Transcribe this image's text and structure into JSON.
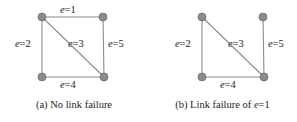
{
  "figure": {
    "background_color": "#ffffff",
    "node_color": "#8c8c8c",
    "node_stroke_color": "#6f6f6f",
    "edge_color": "#8c8c8c",
    "text_color": "#231f20",
    "node_radius": 4
  },
  "panels": [
    {
      "id": "a",
      "caption_prefix": "(a)",
      "caption_text": "No link failure",
      "caption_suffix": "",
      "nodes": [
        {
          "id": "n1",
          "name": "top-left-node",
          "x": 42,
          "y": 17
        },
        {
          "id": "n2",
          "name": "top-right-node",
          "x": 103,
          "y": 17
        },
        {
          "id": "n3",
          "name": "bottom-left-node",
          "x": 42,
          "y": 77
        },
        {
          "id": "n4",
          "name": "bottom-right-node",
          "x": 104,
          "y": 77
        }
      ],
      "edges": [
        {
          "id": "e1",
          "name": "edge-e1-top",
          "label": "e=1",
          "from": "n1",
          "to": "n2",
          "x1": 42,
          "y1": 17,
          "x2": 103,
          "y2": 17,
          "present": true,
          "label_x": 60,
          "label_y": 5
        },
        {
          "id": "e2",
          "name": "edge-e2-left",
          "label": "e=2",
          "from": "n1",
          "to": "n3",
          "x1": 42,
          "y1": 17,
          "x2": 42,
          "y2": 77,
          "present": true,
          "label_x": 15,
          "label_y": 39
        },
        {
          "id": "e3",
          "name": "edge-e3-diagonal",
          "label": "e=3",
          "from": "n1",
          "to": "n4",
          "x1": 42,
          "y1": 17,
          "x2": 104,
          "y2": 77,
          "present": true,
          "label_x": 68,
          "label_y": 39
        },
        {
          "id": "e4",
          "name": "edge-e4-bottom",
          "label": "e=4",
          "from": "n3",
          "to": "n4",
          "x1": 42,
          "y1": 77,
          "x2": 104,
          "y2": 77,
          "present": true,
          "label_x": 60,
          "label_y": 80
        },
        {
          "id": "e5",
          "name": "edge-e5-right",
          "label": "e=5",
          "from": "n2",
          "to": "n4",
          "x1": 103,
          "y1": 17,
          "x2": 104,
          "y2": 77,
          "present": true,
          "label_x": 108,
          "label_y": 39
        }
      ]
    },
    {
      "id": "b",
      "caption_prefix": "(b)",
      "caption_text": "Link failure of ",
      "caption_suffix": "e=1",
      "nodes": [
        {
          "id": "n1",
          "name": "top-left-node",
          "x": 54,
          "y": 17
        },
        {
          "id": "n2",
          "name": "top-right-node",
          "x": 115,
          "y": 17
        },
        {
          "id": "n3",
          "name": "bottom-left-node",
          "x": 54,
          "y": 77
        },
        {
          "id": "n4",
          "name": "bottom-right-node",
          "x": 116,
          "y": 77
        }
      ],
      "edges": [
        {
          "id": "e2",
          "name": "edge-e2-left",
          "label": "e=2",
          "from": "n1",
          "to": "n3",
          "x1": 54,
          "y1": 17,
          "x2": 54,
          "y2": 77,
          "present": true,
          "label_x": 27,
          "label_y": 39
        },
        {
          "id": "e3",
          "name": "edge-e3-diagonal",
          "label": "e=3",
          "from": "n1",
          "to": "n4",
          "x1": 54,
          "y1": 17,
          "x2": 116,
          "y2": 77,
          "present": true,
          "label_x": 80,
          "label_y": 39
        },
        {
          "id": "e4",
          "name": "edge-e4-bottom",
          "label": "e=4",
          "from": "n3",
          "to": "n4",
          "x1": 54,
          "y1": 77,
          "x2": 116,
          "y2": 77,
          "present": true,
          "label_x": 72,
          "label_y": 80
        },
        {
          "id": "e5",
          "name": "edge-e5-right",
          "label": "e=5",
          "from": "n2",
          "to": "n4",
          "x1": 115,
          "y1": 17,
          "x2": 116,
          "y2": 77,
          "present": true,
          "label_x": 120,
          "label_y": 39
        }
      ]
    }
  ],
  "caption_y": 100
}
